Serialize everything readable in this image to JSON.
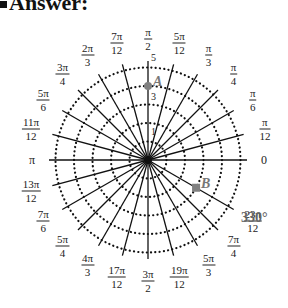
{
  "header": {
    "title": "Answer:"
  },
  "chart_data": {
    "type": "polar_grid",
    "title": "Answer:",
    "center": [
      148,
      160
    ],
    "radial_rings": [
      1,
      2,
      3,
      4,
      5
    ],
    "radial_tick_labels": [
      "1",
      "3",
      "5"
    ],
    "angle_labels": [
      {
        "angle_deg": 0,
        "label": "0"
      },
      {
        "angle_deg": 15,
        "num": "π",
        "den": "12"
      },
      {
        "angle_deg": 30,
        "num": "π",
        "den": "6"
      },
      {
        "angle_deg": 45,
        "num": "π",
        "den": "4"
      },
      {
        "angle_deg": 60,
        "num": "π",
        "den": "3"
      },
      {
        "angle_deg": 75,
        "num": "5π",
        "den": "12"
      },
      {
        "angle_deg": 90,
        "num": "π",
        "den": "2"
      },
      {
        "angle_deg": 105,
        "num": "7π",
        "den": "12"
      },
      {
        "angle_deg": 120,
        "num": "2π",
        "den": "3"
      },
      {
        "angle_deg": 135,
        "num": "3π",
        "den": "4"
      },
      {
        "angle_deg": 150,
        "num": "5π",
        "den": "6"
      },
      {
        "angle_deg": 165,
        "num": "11π",
        "den": "12"
      },
      {
        "angle_deg": 180,
        "label": "π"
      },
      {
        "angle_deg": 195,
        "num": "13π",
        "den": "12"
      },
      {
        "angle_deg": 210,
        "num": "7π",
        "den": "6"
      },
      {
        "angle_deg": 225,
        "num": "5π",
        "den": "4"
      },
      {
        "angle_deg": 240,
        "num": "4π",
        "den": "3"
      },
      {
        "angle_deg": 255,
        "num": "17π",
        "den": "12"
      },
      {
        "angle_deg": 270,
        "num": "3π",
        "den": "2"
      },
      {
        "angle_deg": 285,
        "num": "19π",
        "den": "12"
      },
      {
        "angle_deg": 300,
        "num": "5π",
        "den": "3"
      },
      {
        "angle_deg": 315,
        "num": "7π",
        "den": "4"
      },
      {
        "angle_deg": 330,
        "num": "23π",
        "den": "12"
      }
    ],
    "points": [
      {
        "name": "A",
        "r": 4,
        "theta_deg": 90
      },
      {
        "name": "B",
        "r": 3,
        "theta_deg": 330
      }
    ],
    "annotation": "330°",
    "colors": {
      "grid": "#111111",
      "point": "#808080",
      "label": "#222222"
    }
  }
}
